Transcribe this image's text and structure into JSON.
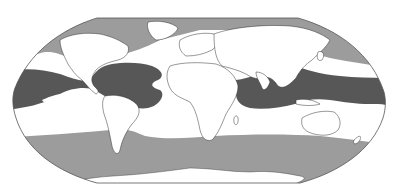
{
  "map": {
    "type": "world-map",
    "projection": "Robinson-like (flat poles)",
    "description": "World map with ocean zones shaded in three tones",
    "colors": {
      "background": "#ffffff",
      "land": "#ffffff",
      "coastline": "#333333",
      "frame": "#555555",
      "light_zone": "#9c9c9c",
      "dark_zone": "#575757",
      "white_zone": "#ffffff"
    },
    "zones": [
      {
        "name": "northern-high-latitude-band",
        "shade": "light"
      },
      {
        "name": "tropical-atlantic-pacific-band",
        "shade": "dark"
      },
      {
        "name": "tropical-indo-pacific-band",
        "shade": "dark"
      },
      {
        "name": "southern-ocean-band",
        "shade": "light"
      },
      {
        "name": "subtropical-gaps",
        "shade": "white"
      }
    ],
    "legend": null,
    "labels": []
  }
}
